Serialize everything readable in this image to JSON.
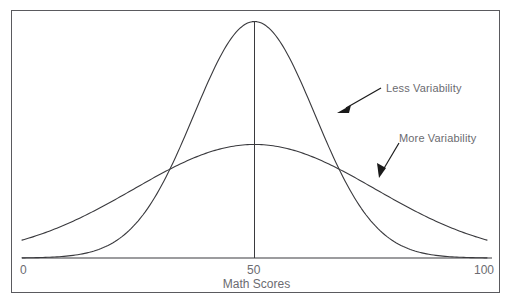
{
  "chart_data": {
    "type": "line",
    "title": "",
    "subtitle": "",
    "xlabel": "Math Scores",
    "ylabel": "",
    "xlim": [
      0,
      100
    ],
    "ylim": [
      0,
      1
    ],
    "xticks": [
      0,
      50,
      100
    ],
    "xtick_labels": [
      "0",
      "50",
      "100"
    ],
    "grid": false,
    "legend_position": "none",
    "series": [
      {
        "name": "Less Variability",
        "distribution": "normal",
        "mean": 50,
        "std": 13,
        "peak_height": 1.0,
        "x": [
          0,
          5,
          10,
          15,
          20,
          25,
          29,
          30,
          35,
          40,
          45,
          50,
          55,
          60,
          65,
          70,
          71,
          75,
          80,
          85,
          90,
          95,
          100
        ],
        "y": [
          0.003,
          0.008,
          0.022,
          0.053,
          0.114,
          0.22,
          0.32,
          0.375,
          0.56,
          0.75,
          0.92,
          1.0,
          0.92,
          0.75,
          0.56,
          0.375,
          0.32,
          0.22,
          0.114,
          0.053,
          0.022,
          0.008,
          0.003
        ]
      },
      {
        "name": "More Variability",
        "distribution": "normal",
        "mean": 50,
        "std": 26,
        "peak_height": 0.48,
        "x": [
          0,
          5,
          10,
          15,
          20,
          25,
          29,
          30,
          35,
          40,
          45,
          50,
          55,
          60,
          65,
          70,
          71,
          75,
          80,
          85,
          90,
          95,
          100
        ],
        "y": [
          0.077,
          0.107,
          0.144,
          0.186,
          0.232,
          0.28,
          0.313,
          0.326,
          0.371,
          0.412,
          0.445,
          0.465,
          0.445,
          0.412,
          0.371,
          0.326,
          0.313,
          0.28,
          0.232,
          0.186,
          0.144,
          0.107,
          0.077
        ]
      }
    ],
    "annotations": [
      {
        "text": "Less Variability",
        "points_to_series": "Less Variability",
        "arrow": true
      },
      {
        "text": "More Variability",
        "points_to_series": "More Variability",
        "arrow": true
      }
    ],
    "colors": {
      "curve": "#3a3a3e",
      "axis": "#3a3a3e",
      "text": "#6b6b70",
      "frame": "#5a5a5e",
      "background": "#ffffff"
    }
  },
  "axis": {
    "xlabel": "Math Scores",
    "ticks": {
      "left": "0",
      "center": "50",
      "right": "100"
    }
  },
  "annotations": {
    "less": "Less Variability",
    "more": "More Variability"
  }
}
